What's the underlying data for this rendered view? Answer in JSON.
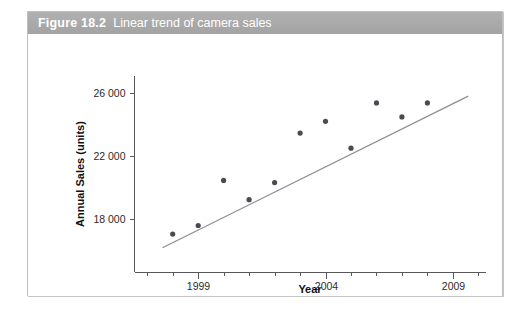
{
  "figure": {
    "number_label": "Figure 18.2",
    "caption": "Linear trend of camera sales"
  },
  "chart_data": {
    "type": "scatter",
    "title": "Linear trend of camera sales",
    "xlabel": "Year",
    "ylabel": "Annual Sales (units)",
    "xlim": [
      1996.5,
      2010.3
    ],
    "ylim": [
      14600,
      27100
    ],
    "grid": false,
    "legend": null,
    "x_ticks_major": [
      1999,
      2004,
      2009
    ],
    "x_tick_labels": [
      "1999",
      "2004",
      "2009"
    ],
    "x_ticks_minor": [
      1997,
      1998,
      2000,
      2001,
      2002,
      2003,
      2005,
      2006,
      2007,
      2008,
      2010
    ],
    "y_ticks": [
      18000,
      22000,
      26000
    ],
    "y_tick_labels": [
      "18 000",
      "22 000",
      "26 000"
    ],
    "series": [
      {
        "name": "Annual Sales (units)",
        "kind": "scatter",
        "marker": "circle",
        "color": "#4a4a52",
        "x": [
          1998,
          1999,
          2000,
          2001,
          2002,
          2003,
          2004,
          2005,
          2006,
          2007,
          2008
        ],
        "values": [
          17040,
          17590,
          20460,
          19230,
          20320,
          23470,
          24220,
          22510,
          25390,
          24500,
          25390
        ]
      },
      {
        "name": "Linear trend",
        "kind": "line",
        "color": "#8d8d93",
        "x": [
          1997.6,
          2009.6
        ],
        "values": [
          16170,
          25820
        ]
      }
    ]
  }
}
